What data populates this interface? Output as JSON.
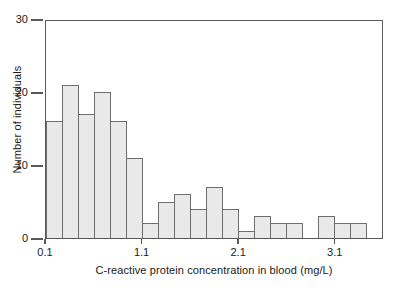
{
  "chart_data": {
    "type": "bar",
    "title": "",
    "xlabel": "C-reactive protein concentration in blood (mg/L)",
    "ylabel": "Number of individuals",
    "ylim": [
      0,
      30
    ],
    "yticks": [
      0,
      10,
      20,
      30
    ],
    "ytick_labels": [
      "0",
      "10",
      "20",
      "30"
    ],
    "xlim": [
      0.1,
      3.6
    ],
    "xticks": [
      0.1,
      1.1,
      2.1,
      3.1
    ],
    "xtick_labels": [
      "0.1",
      "1.1",
      "2.1",
      "3.1"
    ],
    "grid": false,
    "legend": "none",
    "bin_width": 0.1667,
    "bar_fill_color": "#e9e9e9",
    "bar_edge_color": "#6e6e6e",
    "axis_color": "#5a5a5a",
    "bin_starts": [
      0.1,
      0.27,
      0.43,
      0.6,
      0.77,
      0.93,
      1.1,
      1.27,
      1.43,
      1.6,
      1.77,
      1.93,
      2.1,
      2.27,
      2.43,
      2.6,
      2.77,
      2.93,
      3.1,
      3.27,
      3.43
    ],
    "categories": [
      "0.10",
      "0.27",
      "0.43",
      "0.60",
      "0.77",
      "0.93",
      "1.10",
      "1.27",
      "1.43",
      "1.60",
      "1.77",
      "1.93",
      "2.10",
      "2.27",
      "2.43",
      "2.60",
      "2.77",
      "2.93",
      "3.10",
      "3.27",
      "3.43"
    ],
    "values": [
      16,
      21,
      17,
      20,
      16,
      11,
      2,
      5,
      6,
      4,
      7,
      4,
      1,
      3,
      2,
      2,
      0,
      3,
      2,
      2,
      0
    ]
  }
}
